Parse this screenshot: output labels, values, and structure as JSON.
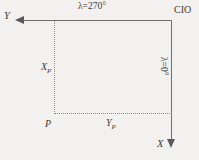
{
  "diagram": {
    "background_color": "#f2f1ef",
    "line_color": "#6e6e6e",
    "dotted_color": "#8a8a8a",
    "text_color": "#3c3c3c",
    "labels": {
      "lambda_270": "λ=270°",
      "lambda_0": "λ=0°",
      "cio": "CIO",
      "y_axis": "Y",
      "x_axis": "X",
      "point_p": "P",
      "x_p_main": "X",
      "x_p_sub": "P",
      "y_p_main": "Y",
      "y_p_sub": "P"
    }
  }
}
